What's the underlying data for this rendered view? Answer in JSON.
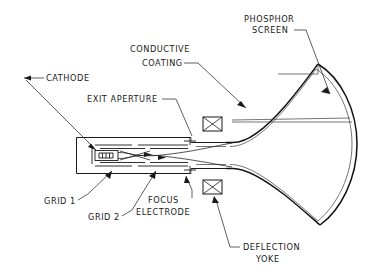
{
  "diagram": {
    "stroke_color": "#1a1a1a",
    "background_color": "#ffffff",
    "labels": {
      "phosphor_screen_line1": "PHOSPHOR",
      "phosphor_screen_line2": "SCREEN",
      "conductive_coating_line1": "CONDUCTIVE",
      "conductive_coating_line2": "COATING",
      "cathode": "CATHODE",
      "exit_aperture": "EXIT APERTURE",
      "grid_1": "GRID 1",
      "grid_2": "GRID 2",
      "focus_electrode_line1": "FOCUS",
      "focus_electrode_line2": "ELECTRODE",
      "deflection_yoke_line1": "DEFLECTION",
      "deflection_yoke_line2": "YOKE"
    },
    "components": [
      "phosphor-screen",
      "conductive-coating",
      "cathode",
      "exit-aperture",
      "grid-1",
      "grid-2",
      "focus-electrode",
      "deflection-yoke",
      "electron-beam",
      "tube-neck",
      "tube-funnel"
    ]
  }
}
